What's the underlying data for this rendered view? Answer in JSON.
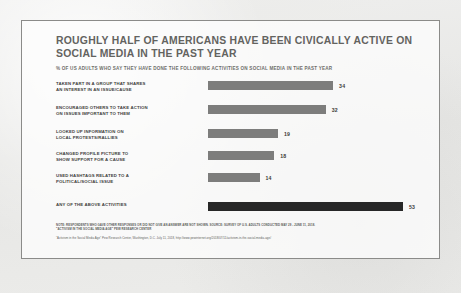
{
  "slide": {
    "title": "ROUGHLY HALF OF AMERICANS HAVE BEEN CIVICALLY ACTIVE ON\nSOCIAL MEDIA IN THE PAST YEAR",
    "subtitle": "% OF US ADULTS WHO SAY THEY HAVE DONE THE FOLLOWING ACTIVITIES ON SOCIAL MEDIA IN THE PAST YEAR",
    "note": "NOTE: RESPONDENTS WHO GAVE OTHER RESPONSES OR DID NOT GIVE AN ANSWER ARE NOT SHOWN. SOURCE: SURVEY OF U.S. ADULTS CONDUCTED MAY 29 - JUNE 11, 2018.\n\"ACTIVISM IN THE SOCIAL MEDIA AGE\" PEW RESEARCH CENTER",
    "source": "\"Activism in the Social Media Age\" Pew Research Center, Washington, D.C. July 11, 2018, http://www.pewinternet.org/2018/07/11/activism-in-the-social-media-age/"
  },
  "colors": {
    "bar": "#7d7d7c",
    "bar_highlight": "#272727",
    "title_text": "#63635f",
    "label_text": "#3f3f3d",
    "page_background": "#e9e9e7",
    "slide_background": "#fdfdfc",
    "slide_border": "#8b8b89"
  },
  "chart_data": {
    "type": "bar",
    "orientation": "horizontal",
    "title": "ROUGHLY HALF OF AMERICANS HAVE BEEN CIVICALLY ACTIVE ON SOCIAL MEDIA IN THE PAST YEAR",
    "subtitle": "% OF US ADULTS WHO SAY THEY HAVE DONE THE FOLLOWING ACTIVITIES ON SOCIAL MEDIA IN THE PAST YEAR",
    "xlabel": "",
    "ylabel": "",
    "xlim": [
      0,
      60
    ],
    "grid": false,
    "legend": false,
    "categories": [
      "TAKEN PART IN A GROUP THAT SHARES\nAN INTEREST IN AN ISSUE/CAUSE",
      "ENCOURAGED OTHERS TO TAKE ACTION\nON ISSUES IMPORTANT TO THEM",
      "LOOKED UP INFORMATION ON\nLOCAL PROTESTS/RALLIES",
      "CHANGED PROFILE PICTURE TO\nSHOW SUPPORT FOR A CAUSE",
      "USED HASHTAGS RELATED TO A\nPOLITICAL/SOCIAL ISSUE",
      "ANY OF THE ABOVE ACTIVITIES"
    ],
    "values": [
      34,
      32,
      19,
      18,
      14,
      53
    ],
    "value_labels": [
      "34",
      "32",
      "19",
      "18",
      "14",
      "53"
    ],
    "highlight_index": 5
  }
}
